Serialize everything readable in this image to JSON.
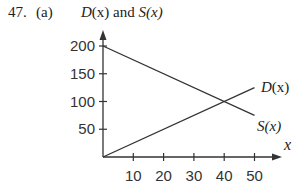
{
  "problem": {
    "number": "47.",
    "part": "(a)"
  },
  "chart_data": {
    "type": "line",
    "title": "D(x) and S(x)",
    "xlabel": "x",
    "ylabel": "D(x) and S(x)",
    "x_ticks": [
      "10",
      "20",
      "30",
      "40",
      "50"
    ],
    "y_ticks": [
      "50",
      "100",
      "150",
      "200"
    ],
    "xlim": [
      0,
      55
    ],
    "ylim": [
      0,
      215
    ],
    "grid": false,
    "legend": "inline labels at line ends",
    "series": [
      {
        "name": "D(x)",
        "x": [
          0,
          50
        ],
        "y": [
          0,
          125
        ]
      },
      {
        "name": "S(x)",
        "x": [
          0,
          50
        ],
        "y": [
          200,
          75
        ]
      }
    ],
    "annotations": [
      {
        "text": "D(x)",
        "at": [
          50,
          125
        ]
      },
      {
        "text": "S(x)",
        "at": [
          50,
          75
        ]
      }
    ]
  },
  "labels": {
    "title_D": "D",
    "title_x1": "(x)",
    "title_and": " and ",
    "title_S": "S",
    "title_x2": "(x)",
    "xaxis": "x",
    "D_label": "D(x)",
    "S_label": "S(x)"
  }
}
